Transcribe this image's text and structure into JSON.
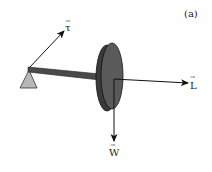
{
  "figure": {
    "panel_label": "(a)",
    "vectors": {
      "torque": {
        "symbol": "τ",
        "arrow_over": "→"
      },
      "angular_momentum": {
        "symbol": "L",
        "arrow_over": "→"
      },
      "weight": {
        "symbol": "W",
        "arrow_over": "→"
      }
    },
    "colors": {
      "disk_face": "#5a5a5a",
      "disk_rim": "#3a3a3a",
      "rod": "#4a4a4a",
      "pivot": "#b8b8b8",
      "line": "#111111"
    }
  }
}
